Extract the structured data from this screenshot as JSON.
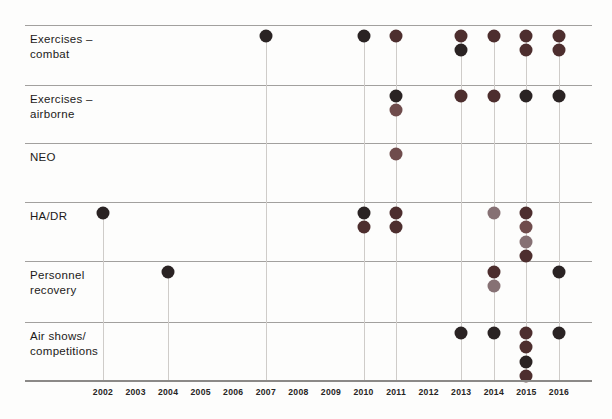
{
  "chart_data": {
    "type": "scatter",
    "title": "",
    "xlabel": "",
    "ylabel": "",
    "legend": "none",
    "x_ticks": [
      2002,
      2003,
      2004,
      2005,
      2006,
      2007,
      2008,
      2009,
      2010,
      2011,
      2012,
      2013,
      2014,
      2015,
      2016
    ],
    "x_range": [
      2002,
      2016
    ],
    "categories": [
      "Exercises –\ncombat",
      "Exercises –\nairborne",
      "NEO",
      "HA/DR",
      "Personnel\nrecovery",
      "Air shows/\ncompetitions"
    ],
    "dot_colors": {
      "black": "#2a2323",
      "darkred": "#4d2e2e",
      "medred": "#6f4c4c",
      "rose": "#867174"
    },
    "grid": "horizontal row separators; vertical droplines only in years with events",
    "events": [
      {
        "row": 0,
        "category": "Exercises – combat",
        "year": 2007,
        "dots": [
          "black"
        ]
      },
      {
        "row": 0,
        "category": "Exercises – combat",
        "year": 2010,
        "dots": [
          "black"
        ]
      },
      {
        "row": 0,
        "category": "Exercises – combat",
        "year": 2011,
        "dots": [
          "darkred"
        ]
      },
      {
        "row": 0,
        "category": "Exercises – combat",
        "year": 2013,
        "dots": [
          "darkred",
          "black"
        ]
      },
      {
        "row": 0,
        "category": "Exercises – combat",
        "year": 2014,
        "dots": [
          "darkred"
        ]
      },
      {
        "row": 0,
        "category": "Exercises – combat",
        "year": 2015,
        "dots": [
          "darkred",
          "darkred"
        ]
      },
      {
        "row": 0,
        "category": "Exercises – combat",
        "year": 2016,
        "dots": [
          "darkred",
          "darkred"
        ]
      },
      {
        "row": 1,
        "category": "Exercises – airborne",
        "year": 2011,
        "dots": [
          "black",
          "medred"
        ]
      },
      {
        "row": 1,
        "category": "Exercises – airborne",
        "year": 2013,
        "dots": [
          "darkred"
        ]
      },
      {
        "row": 1,
        "category": "Exercises – airborne",
        "year": 2014,
        "dots": [
          "darkred"
        ]
      },
      {
        "row": 1,
        "category": "Exercises – airborne",
        "year": 2015,
        "dots": [
          "black"
        ]
      },
      {
        "row": 1,
        "category": "Exercises – airborne",
        "year": 2016,
        "dots": [
          "black"
        ]
      },
      {
        "row": 2,
        "category": "NEO",
        "year": 2011,
        "dots": [
          "medred"
        ]
      },
      {
        "row": 3,
        "category": "HA/DR",
        "year": 2002,
        "dots": [
          "black"
        ]
      },
      {
        "row": 3,
        "category": "HA/DR",
        "year": 2010,
        "dots": [
          "black",
          "darkred"
        ]
      },
      {
        "row": 3,
        "category": "HA/DR",
        "year": 2011,
        "dots": [
          "darkred",
          "darkred"
        ]
      },
      {
        "row": 3,
        "category": "HA/DR",
        "year": 2014,
        "dots": [
          "rose"
        ]
      },
      {
        "row": 3,
        "category": "HA/DR",
        "year": 2015,
        "dots": [
          "darkred",
          "medred",
          "rose",
          "darkred"
        ]
      },
      {
        "row": 4,
        "category": "Personnel recovery",
        "year": 2004,
        "dots": [
          "black"
        ]
      },
      {
        "row": 4,
        "category": "Personnel recovery",
        "year": 2014,
        "dots": [
          "darkred",
          "rose"
        ]
      },
      {
        "row": 4,
        "category": "Personnel recovery",
        "year": 2016,
        "dots": [
          "black"
        ]
      },
      {
        "row": 5,
        "category": "Air shows/competitions",
        "year": 2013,
        "dots": [
          "black"
        ]
      },
      {
        "row": 5,
        "category": "Air shows/competitions",
        "year": 2014,
        "dots": [
          "black"
        ]
      },
      {
        "row": 5,
        "category": "Air shows/competitions",
        "year": 2015,
        "dots": [
          "darkred",
          "darkred",
          "black",
          "darkred"
        ]
      },
      {
        "row": 5,
        "category": "Air shows/competitions",
        "year": 2016,
        "dots": [
          "black"
        ]
      }
    ]
  }
}
